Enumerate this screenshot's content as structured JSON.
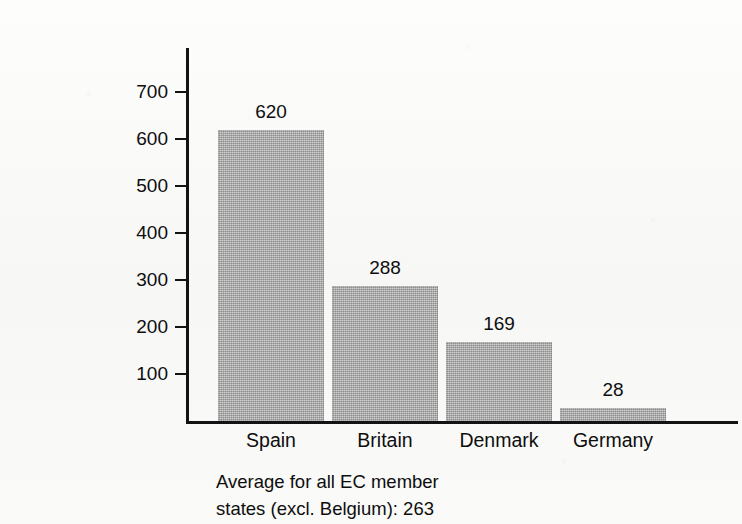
{
  "chart_data": {
    "type": "bar",
    "title": "",
    "subtitle": "",
    "xlabel": "",
    "ylabel": "Working days lost/1000 employees",
    "categories": [
      "Spain",
      "Britain",
      "Denmark",
      "Germany"
    ],
    "values": [
      620,
      288,
      169,
      28
    ],
    "value_labels": [
      "620",
      "288",
      "169",
      "28"
    ],
    "series": [
      {
        "name": "Working days lost per 1000 employees",
        "values": [
          620,
          288,
          169,
          28
        ]
      }
    ],
    "ylim": [
      0,
      740
    ],
    "ytick_values": [
      700,
      600,
      500,
      400,
      300,
      200,
      100
    ],
    "ytick_labels": [
      "700",
      "600",
      "500",
      "400",
      "300",
      "200",
      "100"
    ],
    "grid": false,
    "legend": false,
    "legend_position": "none",
    "bar_color": "#9d9d9d",
    "axis_color": "#131313",
    "background_color": "#fbfbfa",
    "annotations": [
      "Average for all EC member",
      "states (excl. Belgium): 263"
    ],
    "average_all_ec_excl_belgium": 263
  },
  "caption": {
    "line1": "Average for all EC member",
    "line2": "states (excl. Belgium): 263"
  },
  "axis": {
    "y_title": "Working days lost/1000 employees"
  }
}
